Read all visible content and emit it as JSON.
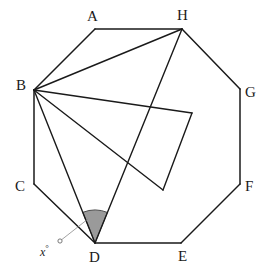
{
  "figure": {
    "width": 272,
    "height": 276,
    "background_color": "#ffffff",
    "stroke_color": "#1a1a1a",
    "shade_fill_color": "#9a9a9a",
    "shade_stroke_color": "#4d4d4d"
  },
  "chart_data": {
    "type": "diagram",
    "shape": "regular-octagon",
    "title": "",
    "vertices": [
      {
        "id": "A",
        "label": "A",
        "x": 95,
        "y": 29,
        "label_x": 87,
        "label_y": 9
      },
      {
        "id": "H",
        "label": "H",
        "x": 182,
        "y": 29,
        "label_x": 177,
        "label_y": 8
      },
      {
        "id": "G",
        "label": "G",
        "x": 240,
        "y": 89,
        "label_x": 245,
        "label_y": 85
      },
      {
        "id": "F",
        "label": "F",
        "x": 240,
        "y": 184,
        "label_x": 245,
        "label_y": 179
      },
      {
        "id": "E",
        "label": "E",
        "x": 181,
        "y": 243,
        "label_x": 178,
        "label_y": 249
      },
      {
        "id": "D",
        "label": "D",
        "x": 95,
        "y": 243,
        "label_x": 89,
        "label_y": 250
      },
      {
        "id": "C",
        "label": "C",
        "x": 34,
        "y": 184,
        "label_x": 15,
        "label_y": 179
      },
      {
        "id": "B",
        "label": "B",
        "x": 34,
        "y": 90,
        "label_x": 16,
        "label_y": 78
      }
    ],
    "polygon_edges": [
      [
        "A",
        "H"
      ],
      [
        "H",
        "G"
      ],
      [
        "G",
        "F"
      ],
      [
        "F",
        "E"
      ],
      [
        "E",
        "D"
      ],
      [
        "D",
        "C"
      ],
      [
        "C",
        "B"
      ],
      [
        "B",
        "A"
      ]
    ],
    "diagonals": [
      {
        "from": "B",
        "to": "H"
      },
      {
        "from": "B",
        "to": "D"
      },
      {
        "from": "H",
        "to": "D"
      }
    ],
    "inner_points": [
      {
        "id": "P",
        "x": 192,
        "y": 113
      },
      {
        "id": "Q",
        "x": 163,
        "y": 190
      }
    ],
    "inner_segments": [
      {
        "from": "B",
        "to": "P"
      },
      {
        "from": "B",
        "to": "Q"
      },
      {
        "from": "P",
        "to": "Q"
      }
    ],
    "angle_marker": {
      "vertex": "D",
      "label": "x",
      "degree_symbol": "°",
      "from_ray_to": "B",
      "to_ray_to": "H",
      "radius": 33,
      "shaded": true,
      "label_x": 40,
      "label_y": 244,
      "leader_from_x": 60,
      "leader_from_y": 241,
      "leader_to_x": 88,
      "leader_to_y": 219
    },
    "labels": [
      "A",
      "H",
      "G",
      "F",
      "E",
      "D",
      "C",
      "B",
      "x°"
    ]
  }
}
